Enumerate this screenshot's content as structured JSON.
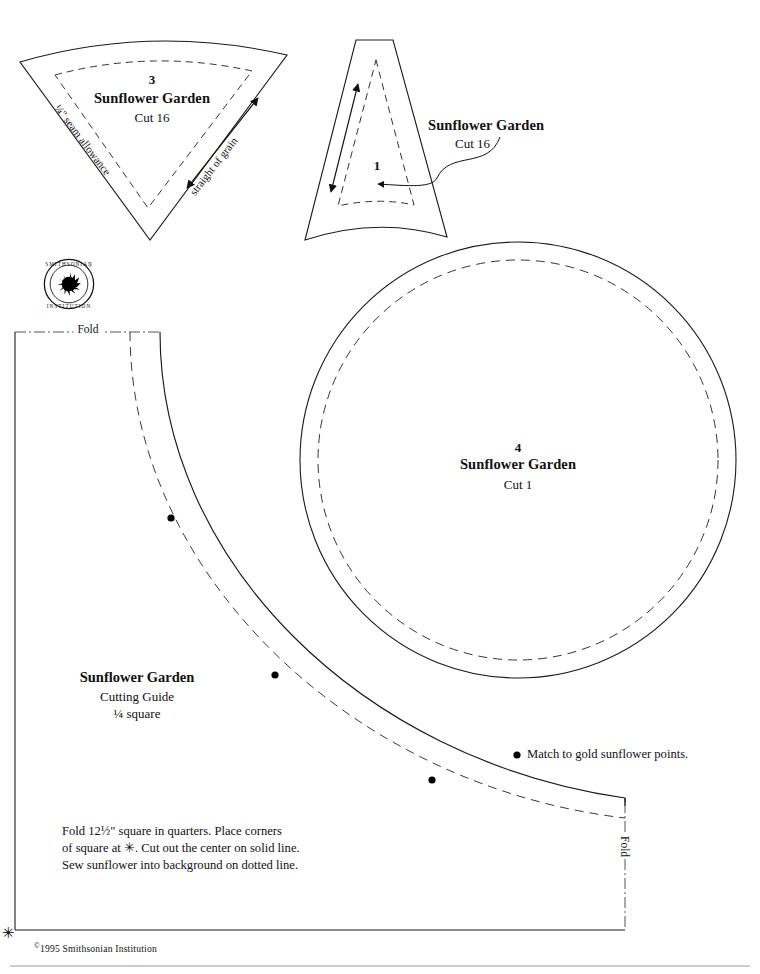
{
  "document": {
    "kind": "quilt-pattern-template-sheet",
    "copyright": "1995 Smithsonian Institution",
    "copyright_symbol": "©",
    "logo_alt": "smithsonian-institution-seal",
    "logo_ring_text_top": "SMITHSONIAN",
    "logo_ring_text_bottom": "INSTITUTION"
  },
  "pieces": [
    {
      "id": "piece-3",
      "number": "3",
      "title": "Sunflower Garden",
      "cut": "Cut 16",
      "annotations": {
        "seam_allowance": "¼\" seam allowance",
        "grain": "straight of grain"
      }
    },
    {
      "id": "piece-1",
      "number": "1",
      "title": "Sunflower Garden",
      "cut": "Cut 16"
    },
    {
      "id": "piece-4",
      "number": "4",
      "title": "Sunflower Garden",
      "cut": "Cut 1"
    }
  ],
  "cutting_guide": {
    "title": "Sunflower Garden",
    "subtitle": "Cutting Guide",
    "fraction": "¼ square",
    "fold_top": "Fold",
    "fold_right": "Fold",
    "instructions": "Fold 12½\" square in quarters. Place corners\nof square at ✳. Cut out the center on solid line.\nSew sunflower into background on dotted line.",
    "legend": "Match to gold sunflower points.",
    "corner_mark": "✳"
  },
  "colors": {
    "ink": "#111111",
    "line": "#1a1a1a",
    "dash": "#3a3a3a",
    "paper": "#ffffff"
  }
}
